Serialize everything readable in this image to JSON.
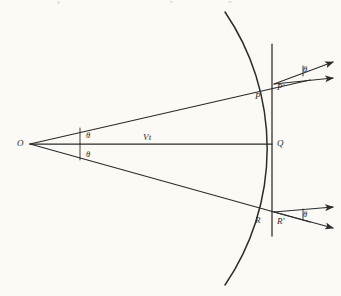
{
  "figure": {
    "background_color": "#fbfaf5",
    "ink_color": "#2b2b2b",
    "labels": {
      "origin": "O",
      "vertex_q": "Q",
      "point_p": "P",
      "point_p_prime": "P'",
      "point_r": "R",
      "point_r_prime": "R'",
      "distance": "Vt",
      "angle_upper": "θ",
      "angle_lower": "θ",
      "angle_top_right": "θ",
      "angle_bottom_right": "θ"
    }
  },
  "chart_data": {
    "type": "diagram",
    "points": [
      {
        "name": "O",
        "x": 30,
        "y": 144,
        "label": "O",
        "label_dx": -13,
        "label_dy": -5
      },
      {
        "name": "Q",
        "x": 272,
        "y": 144,
        "label": "Q",
        "label_dx": 5,
        "label_dy": -5
      },
      {
        "name": "P",
        "x": 257,
        "y": 88,
        "label": "P",
        "label_dx": -2,
        "label_dy": 4
      },
      {
        "name": "P'",
        "x": 274,
        "y": 84,
        "label": "P'",
        "label_dx": 3,
        "label_dy": -1
      },
      {
        "name": "R",
        "x": 257,
        "y": 213,
        "label": "R",
        "label_dx": -2,
        "label_dy": 3
      },
      {
        "name": "R'",
        "x": 274,
        "y": 217,
        "label": "R'",
        "label_dx": 3,
        "label_dy": 0
      }
    ],
    "segments": [
      {
        "name": "axis-oq",
        "x1": 30,
        "y1": 144,
        "x2": 272,
        "y2": 144
      },
      {
        "name": "ray-upper-op",
        "x1": 30,
        "y1": 144,
        "x2": 310,
        "y2": 80
      },
      {
        "name": "ray-lower-or",
        "x1": 30,
        "y1": 144,
        "x2": 310,
        "y2": 222
      },
      {
        "name": "vertical-line",
        "x1": 272,
        "y1": 44,
        "x2": 272,
        "y2": 236
      },
      {
        "name": "tick-upper",
        "x1": 80,
        "y1": 128,
        "x2": 80,
        "y2": 144
      },
      {
        "name": "tick-lower",
        "x1": 80,
        "y1": 144,
        "x2": 80,
        "y2": 160
      }
    ],
    "arc": {
      "name": "wavefront-arc",
      "center_x": 30,
      "center_y": 144,
      "radius": 242,
      "start_x": 225,
      "start_y": 12,
      "end_x": 225,
      "end_y": 285,
      "through_x": 272,
      "through_y": 144
    },
    "arrows": [
      {
        "name": "arrow-top-slanted",
        "x1": 274,
        "y1": 84,
        "x2": 333,
        "y2": 62
      },
      {
        "name": "arrow-top-horizontal",
        "x1": 274,
        "y1": 84,
        "x2": 333,
        "y2": 78
      },
      {
        "name": "arrow-bot-horizontal",
        "x1": 274,
        "y1": 212,
        "x2": 333,
        "y2": 207
      },
      {
        "name": "arrow-bot-slanted",
        "x1": 274,
        "y1": 212,
        "x2": 333,
        "y2": 228
      }
    ],
    "angles": [
      {
        "name": "theta-upper-at-o",
        "label": "θ",
        "x": 86,
        "y": 131
      },
      {
        "name": "theta-lower-at-o",
        "label": "θ",
        "x": 86,
        "y": 150
      },
      {
        "name": "theta-top-right",
        "label": "θ",
        "x": 303,
        "y": 65
      },
      {
        "name": "theta-bottom-right",
        "label": "θ",
        "x": 303,
        "y": 210
      }
    ],
    "angle_ticks": [
      {
        "name": "angle-tick-top-right",
        "x1": 303,
        "y1": 66,
        "x2": 303,
        "y2": 76
      },
      {
        "name": "angle-tick-bottom-right",
        "x1": 303,
        "y1": 209,
        "x2": 303,
        "y2": 219
      }
    ]
  }
}
